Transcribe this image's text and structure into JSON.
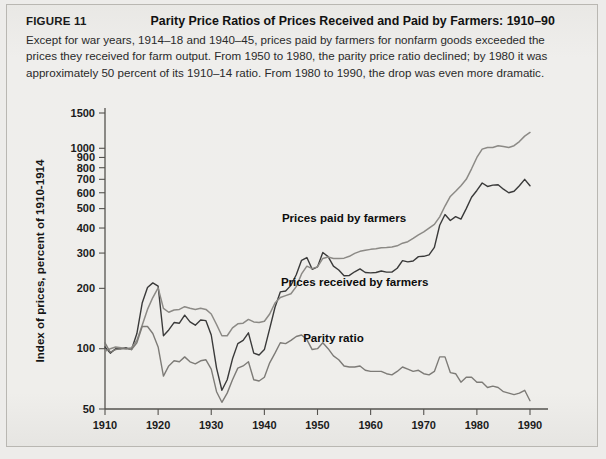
{
  "figure": {
    "number_label": "FIGURE 11",
    "title": "Parity Price Ratios of Prices Received and Paid by Farmers: 1910–90",
    "description": "Except for war years, 1914–18 and 1940–45, prices paid by farmers for nonfarm goods exceeded the prices they received for farm output. From 1950 to 1980, the parity price ratio declined; by 1980 it was approximately 50 percent of its 1910–14 ratio. From 1980 to 1990, the drop was even more dramatic."
  },
  "colors": {
    "panel_background": "#edecea",
    "axis": "#55534f",
    "prices_paid": "#8c8a86",
    "prices_received": "#3a3a3a",
    "parity_ratio": "#7d7b77",
    "text": "#1a1a1a"
  },
  "chart_data": {
    "type": "line",
    "title": "Parity Price Ratios of Prices Received and Paid by Farmers: 1910–90",
    "xlabel": "",
    "ylabel": "Index of prices, percent of 1910-1914",
    "yscale": "log",
    "ylim": [
      50,
      1500
    ],
    "xlim": [
      1910,
      1990
    ],
    "grid": false,
    "legend": "inline-annotations",
    "ytick_labels": [
      "50",
      "100",
      "200",
      "300",
      "400",
      "500",
      "600",
      "700",
      "800",
      "900",
      "1000",
      "1500"
    ],
    "yticks": [
      50,
      100,
      200,
      300,
      400,
      500,
      600,
      700,
      800,
      900,
      1000,
      1500
    ],
    "xtick_labels": [
      "1910",
      "1920",
      "1930",
      "1940",
      "1950",
      "1960",
      "1970",
      "1980",
      "1990"
    ],
    "xticks": [
      1910,
      1920,
      1930,
      1940,
      1950,
      1960,
      1970,
      1980,
      1990
    ],
    "annotations": [
      {
        "text": "Prices paid by farmers",
        "x": 1955,
        "y": 430
      },
      {
        "text": "Prices received by farmers",
        "x": 1957,
        "y": 205
      },
      {
        "text": "Parity ratio",
        "x": 1953,
        "y": 108
      }
    ],
    "x": [
      1910,
      1911,
      1912,
      1913,
      1914,
      1915,
      1916,
      1917,
      1918,
      1919,
      1920,
      1921,
      1922,
      1923,
      1924,
      1925,
      1926,
      1927,
      1928,
      1929,
      1930,
      1931,
      1932,
      1933,
      1934,
      1935,
      1936,
      1937,
      1938,
      1939,
      1940,
      1941,
      1942,
      1943,
      1944,
      1945,
      1946,
      1947,
      1948,
      1949,
      1950,
      1951,
      1952,
      1953,
      1954,
      1955,
      1956,
      1957,
      1958,
      1959,
      1960,
      1961,
      1962,
      1963,
      1964,
      1965,
      1966,
      1967,
      1968,
      1969,
      1970,
      1971,
      1972,
      1973,
      1974,
      1975,
      1976,
      1977,
      1978,
      1979,
      1980,
      1981,
      1982,
      1983,
      1984,
      1985,
      1986,
      1987,
      1988,
      1989,
      1990
    ],
    "series": [
      {
        "name": "Prices received by farmers",
        "color": "#3a3a3a",
        "values": [
          102,
          95,
          100,
          100,
          101,
          99,
          119,
          169,
          202,
          213,
          205,
          116,
          124,
          135,
          134,
          147,
          136,
          131,
          139,
          138,
          117,
          80,
          62,
          70,
          89,
          106,
          110,
          120,
          95,
          93,
          99,
          126,
          161,
          192,
          194,
          207,
          234,
          276,
          285,
          249,
          256,
          302,
          288,
          258,
          247,
          231,
          232,
          242,
          250,
          240,
          239,
          240,
          244,
          241,
          241,
          252,
          275,
          271,
          274,
          288,
          289,
          294,
          320,
          413,
          467,
          436,
          456,
          443,
          500,
          570,
          616,
          671,
          645,
          655,
          658,
          625,
          600,
          610,
          650,
          700,
          650
        ],
        "endpoint_1990_label": "~650"
      },
      {
        "name": "Prices paid by farmers",
        "color": "#8c8a86",
        "values": [
          97,
          100,
          102,
          101,
          100,
          101,
          110,
          131,
          157,
          180,
          201,
          159,
          152,
          156,
          157,
          162,
          159,
          157,
          159,
          157,
          149,
          132,
          116,
          116,
          127,
          133,
          134,
          140,
          136,
          135,
          137,
          149,
          169,
          180,
          184,
          188,
          204,
          236,
          258,
          251,
          256,
          282,
          287,
          282,
          282,
          283,
          289,
          299,
          306,
          310,
          313,
          315,
          319,
          320,
          322,
          326,
          336,
          342,
          355,
          370,
          383,
          400,
          417,
          455,
          515,
          575,
          610,
          650,
          700,
          790,
          900,
          990,
          1010,
          1010,
          1030,
          1020,
          1010,
          1030,
          1080,
          1150,
          1200
        ],
        "endpoint_1990_label": "~1200"
      },
      {
        "name": "Parity ratio",
        "color": "#7d7b77",
        "values": [
          107,
          96,
          99,
          100,
          100,
          99,
          107,
          129,
          129,
          119,
          102,
          73,
          82,
          87,
          86,
          91,
          86,
          84,
          87,
          88,
          79,
          61,
          54,
          60,
          70,
          80,
          82,
          86,
          70,
          69,
          72,
          85,
          95,
          107,
          106,
          110,
          115,
          117,
          111,
          99,
          100,
          107,
          100,
          92,
          88,
          82,
          81,
          81,
          82,
          78,
          77,
          77,
          77,
          75,
          74,
          77,
          81,
          79,
          77,
          78,
          75,
          74,
          77,
          91,
          91,
          76,
          75,
          68,
          72,
          72,
          68,
          68,
          64,
          65,
          64,
          61,
          60,
          59,
          60,
          62,
          55
        ],
        "endpoint_1990_label": "~55"
      }
    ]
  }
}
